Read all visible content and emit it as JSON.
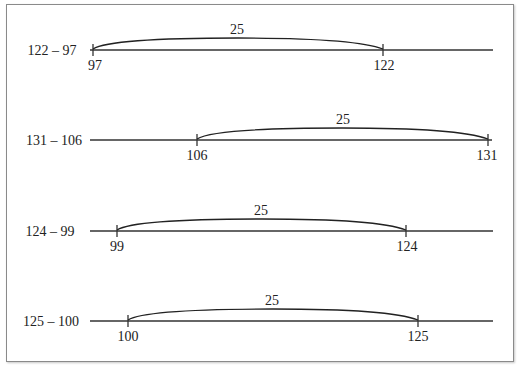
{
  "diagram": {
    "type": "number-line-subtraction",
    "rows": [
      {
        "expression": "122 – 97",
        "start": 97,
        "end": 122,
        "difference": "25",
        "start_label": "97",
        "end_label": "122"
      },
      {
        "expression": "131 – 106",
        "start": 106,
        "end": 131,
        "difference": "25",
        "start_label": "106",
        "end_label": "131"
      },
      {
        "expression": "124 – 99",
        "start": 99,
        "end": 124,
        "difference": "25",
        "start_label": "99",
        "end_label": "124"
      },
      {
        "expression": "125 – 100",
        "start": 100,
        "end": 125,
        "difference": "25",
        "start_label": "100",
        "end_label": "125"
      }
    ]
  }
}
